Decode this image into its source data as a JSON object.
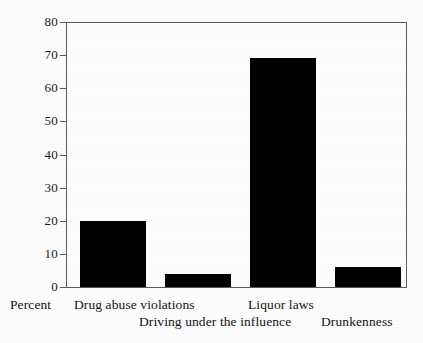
{
  "chart_data": {
    "type": "bar",
    "title": "",
    "xlabel": "",
    "ylabel": "Percent",
    "ylim": [
      0,
      80
    ],
    "grid": false,
    "legend": false,
    "categories": [
      "Drug abuse violations",
      "Driving under the influence",
      "Liquor laws",
      "Drunkenness"
    ],
    "values": [
      20,
      4,
      69,
      6
    ],
    "yticks": [
      0,
      10,
      20,
      30,
      40,
      50,
      60,
      70,
      80
    ],
    "ytick_labels": [
      "0",
      "10",
      "20",
      "30",
      "40",
      "50",
      "60",
      "70",
      "80"
    ],
    "bar_color": "#000000",
    "axis_color": "#5b5b5b",
    "background_color": "#fdfdfd"
  },
  "axis": {
    "y_name": "Percent"
  }
}
